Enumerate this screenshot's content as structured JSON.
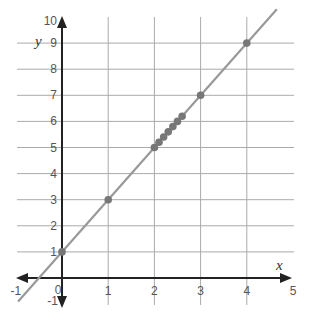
{
  "chart_data": {
    "type": "scatter",
    "title": "",
    "xlabel": "x",
    "ylabel": "y",
    "xlim": [
      -1,
      5
    ],
    "ylim": [
      -1,
      10
    ],
    "grid": true,
    "x_ticks": [
      "-1",
      "0",
      "1",
      "2",
      "3",
      "4",
      "5"
    ],
    "y_ticks": [
      "-1",
      "1",
      "2",
      "3",
      "4",
      "5",
      "6",
      "7",
      "8",
      "9",
      "10"
    ],
    "series": [
      {
        "name": "points",
        "x": [
          0,
          1,
          2,
          2.1,
          2.2,
          2.3,
          2.4,
          2.5,
          2.6,
          3,
          4
        ],
        "y": [
          1,
          3,
          5,
          5.2,
          5.4,
          5.6,
          5.8,
          6.0,
          6.2,
          7,
          9
        ]
      }
    ],
    "line": {
      "equation": "y = 2x + 1",
      "slope": 2,
      "intercept": 1,
      "x_range": [
        -0.95,
        4.65
      ]
    },
    "colors": {
      "line": "#999999",
      "points": "#777777",
      "axis": "#222222",
      "grid": "#aaaaaa"
    }
  }
}
